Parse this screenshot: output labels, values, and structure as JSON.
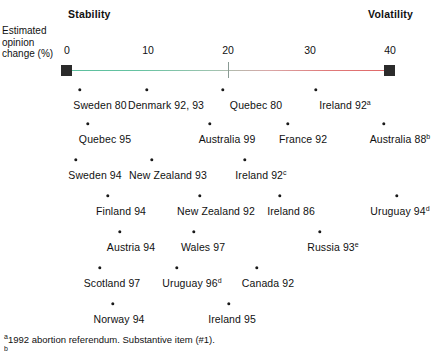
{
  "poles": {
    "left": "Stability",
    "right": "Volatility"
  },
  "axis_caption": {
    "line1": "Estimated",
    "line2": "opinion",
    "line3": "change (%)"
  },
  "axis": {
    "ticks": [
      {
        "value": 0,
        "label": "0",
        "x": 67
      },
      {
        "value": 10,
        "label": "10",
        "x": 148
      },
      {
        "value": 20,
        "label": "20",
        "x": 228
      },
      {
        "value": 30,
        "label": "30",
        "x": 310
      },
      {
        "value": 40,
        "label": "40",
        "x": 390
      }
    ],
    "range": [
      0,
      40
    ],
    "stability_color": "#5bbf9e",
    "volatility_color": "#e06666",
    "endcap_color": "#2b2b2b",
    "mid_tick_value": 20
  },
  "chart_data": {
    "type": "scatter",
    "title": "",
    "xlabel": "Estimated opinion change (%)",
    "ylabel": "",
    "xlim": [
      0,
      40
    ],
    "grid": false,
    "legend": "none",
    "annotations": [
      "Stability",
      "Volatility"
    ],
    "rows": [
      {
        "row": 1,
        "dot_y": 90,
        "label_y": 99,
        "points": [
          {
            "label": "Sweden 80",
            "sup": "",
            "x_px": 80,
            "value": 1.6,
            "label_x": 100
          },
          {
            "label": "Denmark 92, 93",
            "sup": "",
            "x_px": 147,
            "value": 9.9,
            "label_x": 166
          },
          {
            "label": "Quebec 80",
            "sup": "",
            "x_px": 223,
            "value": 19.3,
            "label_x": 256
          },
          {
            "label": "Ireland 92",
            "sup": "a",
            "x_px": 316,
            "value": 30.8,
            "label_x": 345
          }
        ]
      },
      {
        "row": 2,
        "dot_y": 124,
        "label_y": 133,
        "points": [
          {
            "label": "Quebec 95",
            "sup": "",
            "x_px": 88,
            "value": 2.6,
            "label_x": 105
          },
          {
            "label": "Australia 99",
            "sup": "",
            "x_px": 210,
            "value": 17.7,
            "label_x": 227
          },
          {
            "label": "France 92",
            "sup": "",
            "x_px": 288,
            "value": 27.4,
            "label_x": 303
          },
          {
            "label": "Australia 88",
            "sup": "b",
            "x_px": 384,
            "value": 39.3,
            "label_x": 400
          }
        ]
      },
      {
        "row": 3,
        "dot_y": 160,
        "label_y": 169,
        "points": [
          {
            "label": "Sweden 94",
            "sup": "",
            "x_px": 76,
            "value": 1.1,
            "label_x": 95
          },
          {
            "label": "New Zealand 93",
            "sup": "",
            "x_px": 152,
            "value": 10.5,
            "label_x": 168
          },
          {
            "label": "Ireland 92",
            "sup": "c",
            "x_px": 245,
            "value": 22.1,
            "label_x": 261
          }
        ]
      },
      {
        "row": 4,
        "dot_y": 196,
        "label_y": 205,
        "points": [
          {
            "label": "Finland 94",
            "sup": "",
            "x_px": 108,
            "value": 5.1,
            "label_x": 121
          },
          {
            "label": "New Zealand 92",
            "sup": "",
            "x_px": 200,
            "value": 16.5,
            "label_x": 216
          },
          {
            "label": "Ireland 86",
            "sup": "",
            "x_px": 280,
            "value": 26.4,
            "label_x": 291
          },
          {
            "label": "Uruguay 94",
            "sup": "d",
            "x_px": 397,
            "value": 40.9,
            "label_x": 400
          }
        ]
      },
      {
        "row": 5,
        "dot_y": 232,
        "label_y": 241,
        "points": [
          {
            "label": "Austria 94",
            "sup": "",
            "x_px": 120,
            "value": 6.6,
            "label_x": 131
          },
          {
            "label": "Wales 97",
            "sup": "",
            "x_px": 194,
            "value": 15.7,
            "label_x": 203
          },
          {
            "label": "Russia 93",
            "sup": "e",
            "x_px": 320,
            "value": 31.3,
            "label_x": 333
          }
        ]
      },
      {
        "row": 6,
        "dot_y": 268,
        "label_y": 277,
        "points": [
          {
            "label": "Scotland 97",
            "sup": "",
            "x_px": 100,
            "value": 4.1,
            "label_x": 112
          },
          {
            "label": "Uruguay 96",
            "sup": "d",
            "x_px": 177,
            "value": 13.6,
            "label_x": 192
          },
          {
            "label": "Canada 92",
            "sup": "",
            "x_px": 257,
            "value": 23.5,
            "label_x": 268
          }
        ]
      },
      {
        "row": 7,
        "dot_y": 304,
        "label_y": 313,
        "points": [
          {
            "label": "Norway 94",
            "sup": "",
            "x_px": 113,
            "value": 5.7,
            "label_x": 119
          },
          {
            "label": "Ireland 95",
            "sup": "",
            "x_px": 229,
            "value": 20.1,
            "label_x": 232
          }
        ]
      }
    ]
  },
  "footnotes": [
    {
      "marker": "a",
      "text": "1992 abortion referendum. Substantive item (#1)."
    },
    {
      "marker": "b",
      "text": ""
    }
  ]
}
